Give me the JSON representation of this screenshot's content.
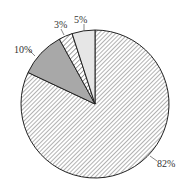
{
  "chart_data": {
    "type": "pie",
    "title": "",
    "start_angle_deg": 90,
    "direction": "clockwise",
    "slices": [
      {
        "label": "82%",
        "value": 82,
        "fill": "hatch-fine"
      },
      {
        "label": "10%",
        "value": 10,
        "fill": "#a8a8a8"
      },
      {
        "label": "3%",
        "value": 3,
        "fill": "hatch-coarse"
      },
      {
        "label": "5%",
        "value": 5,
        "fill": "#e6e6e6"
      }
    ],
    "legend": null
  },
  "colors": {
    "outline": "#222222",
    "hatch": "#555555",
    "dark_gray": "#a8a8a8",
    "light_gray": "#e6e6e6"
  }
}
